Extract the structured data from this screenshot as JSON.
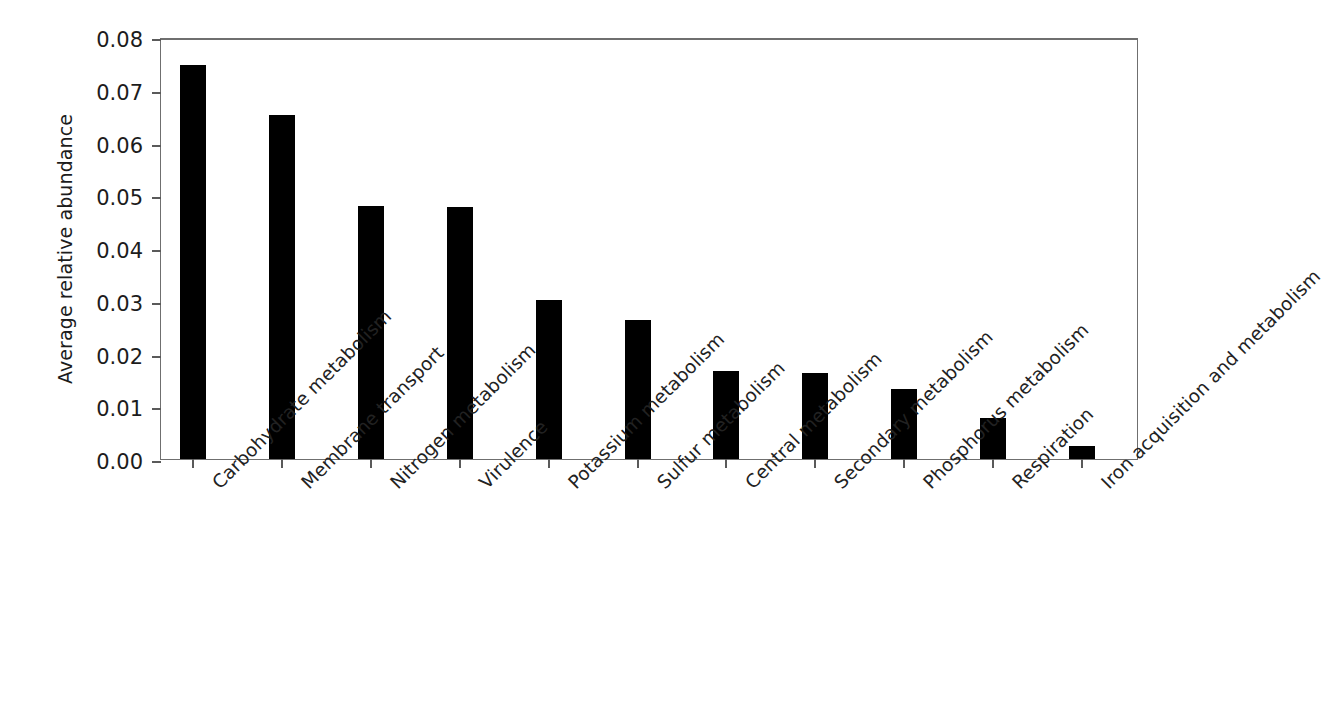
{
  "chart_data": {
    "type": "bar",
    "title": "",
    "subtitle": "",
    "xlabel": "",
    "ylabel": "Average relative abundance",
    "ylim": [
      0,
      0.08
    ],
    "ytick_labels": [
      "0.00",
      "0.01",
      "0.02",
      "0.03",
      "0.04",
      "0.05",
      "0.06",
      "0.07",
      "0.08"
    ],
    "ytick_values": [
      0,
      0.01,
      0.02,
      0.03,
      0.04,
      0.05,
      0.06,
      0.07,
      0.08
    ],
    "grid": false,
    "legend": false,
    "legend_position": "none",
    "bar_color": "#000000",
    "categories": [
      "Carbohydrate metabolism",
      "Membrane transport",
      "Nitrogen metabolism",
      "Virulence",
      "Potassium metabolism",
      "Sulfur metabolism",
      "Central metabolism",
      "Secondary metabolism",
      "Phosphorus metabolism",
      "Respiration",
      "Iron acquisition and metabolism"
    ],
    "values": [
      0.0747,
      0.0653,
      0.0479,
      0.0477,
      0.0301,
      0.0264,
      0.0167,
      0.0164,
      0.0133,
      0.0077,
      0.0025
    ]
  }
}
